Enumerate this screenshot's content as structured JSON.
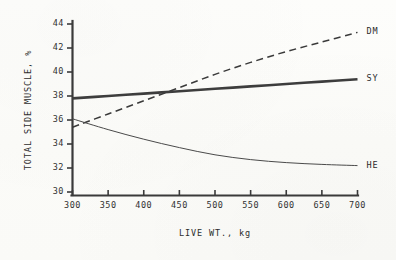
{
  "chart_data": {
    "type": "line",
    "title": "",
    "xlabel": "LIVE WT., kg",
    "ylabel": "TOTAL SIDE MUSCLE, %",
    "xlim": [
      300,
      700
    ],
    "ylim": [
      30,
      44
    ],
    "xticks": [
      300,
      350,
      400,
      450,
      500,
      550,
      600,
      650,
      700
    ],
    "yticks": [
      30,
      32,
      34,
      36,
      38,
      40,
      42,
      44
    ],
    "grid": false,
    "legend_position": "right-inline-end-of-line",
    "x": [
      300,
      350,
      400,
      450,
      500,
      550,
      600,
      650,
      700
    ],
    "series": [
      {
        "name": "DM",
        "label": "DM",
        "style": "dashed",
        "width": 1.5,
        "color": "#3a3a3a",
        "values": [
          35.4,
          36.5,
          37.6,
          38.7,
          39.8,
          40.8,
          41.7,
          42.5,
          43.3
        ]
      },
      {
        "name": "SY",
        "label": "SY",
        "style": "solid-thick",
        "width": 2.6,
        "color": "#3d3d3d",
        "values": [
          37.8,
          38.0,
          38.2,
          38.4,
          38.6,
          38.8,
          39.0,
          39.2,
          39.4
        ]
      },
      {
        "name": "HE",
        "label": "HE",
        "style": "solid-thin",
        "width": 1.0,
        "color": "#4a4a4a",
        "values": [
          36.1,
          35.2,
          34.4,
          33.7,
          33.1,
          32.7,
          32.45,
          32.3,
          32.2
        ]
      }
    ]
  },
  "axis": {
    "y_title": "TOTAL SIDE MUSCLE, %",
    "x_title": "LIVE WT., kg",
    "y_tick_labels": [
      "44",
      "42",
      "40",
      "38",
      "36",
      "34",
      "32",
      "30"
    ],
    "x_tick_labels": [
      "300",
      "350",
      "400",
      "450",
      "500",
      "550",
      "600",
      "650",
      "700"
    ]
  },
  "series_labels": {
    "dm": "DM",
    "sy": "SY",
    "he": "HE"
  },
  "colors": {
    "ink": "#333333",
    "paper": "#fcfcfa",
    "dm": "#3a3a3a",
    "sy": "#3d3d3d",
    "he": "#4a4a4a"
  }
}
